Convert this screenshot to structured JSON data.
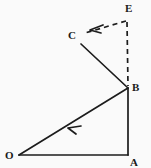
{
  "figure": {
    "background_color": "#fafafa",
    "stroke_color": "#1c1c1c",
    "width": 151,
    "height": 168
  },
  "labels": {
    "E": "E",
    "C": "C",
    "B": "B",
    "O": "O",
    "A": "A"
  },
  "points": {
    "E": {
      "x": 127,
      "y": 20
    },
    "C": {
      "x": 81,
      "y": 44
    },
    "B": {
      "x": 128,
      "y": 88
    },
    "O": {
      "x": 19,
      "y": 155
    },
    "A": {
      "x": 128,
      "y": 155
    }
  },
  "label_positions": {
    "E": {
      "x": 125,
      "y": 12
    },
    "C": {
      "x": 68,
      "y": 39
    },
    "B": {
      "x": 132,
      "y": 91
    },
    "O": {
      "x": 5,
      "y": 159
    },
    "A": {
      "x": 130,
      "y": 166
    }
  },
  "edges": [
    {
      "name": "edge-O-A",
      "from": "O",
      "to": "A",
      "style": "solid",
      "arrow": "none"
    },
    {
      "name": "edge-A-B",
      "from": "A",
      "to": "B",
      "style": "solid",
      "arrow": "none"
    },
    {
      "name": "edge-B-O",
      "from": "B",
      "to": "O",
      "style": "solid",
      "arrow": "midpoint-toward-O"
    },
    {
      "name": "edge-B-C",
      "from": "B",
      "to": "C",
      "style": "solid",
      "arrow": "none"
    },
    {
      "name": "edge-C-E",
      "from": "C",
      "to": "E",
      "style": "dashed",
      "arrow": "toward-C"
    },
    {
      "name": "edge-E-B",
      "from": "E",
      "to": "B",
      "style": "dashed",
      "arrow": "none"
    }
  ],
  "arrows": [
    {
      "name": "arrow-toward-O",
      "tip_x": 68,
      "tip_y": 128,
      "direction": "down-left"
    },
    {
      "name": "arrow-toward-C",
      "tip_x": 93,
      "tip_y": 29,
      "direction": "left-down"
    }
  ]
}
